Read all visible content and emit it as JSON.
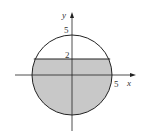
{
  "diagram": {
    "type": "region-in-circle",
    "axes": {
      "x_label": "x",
      "y_label": "y"
    },
    "tick_labels": {
      "x_radius": "5",
      "y_top": "5",
      "y_line": "2"
    },
    "circle": {
      "center": [
        0,
        0
      ],
      "radius": 5
    },
    "line": {
      "equation": "y = 2"
    },
    "shaded_region": "inside circle, y ≤ 2",
    "colors": {
      "shade": "#c8c8c8",
      "stroke": "#222222",
      "background": "#ffffff"
    }
  }
}
